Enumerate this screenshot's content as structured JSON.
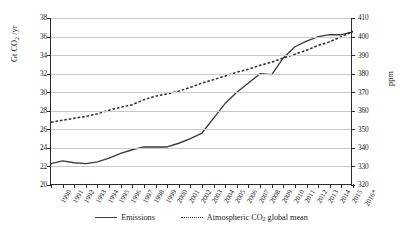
{
  "chart_data": {
    "type": "line",
    "title": "",
    "xlabel": "",
    "ylabel": "Gt CO2 /yr",
    "ylabel_right": "ppm",
    "grid": true,
    "legend_position": "bottom",
    "ylim": [
      20,
      38
    ],
    "ylim_right": [
      320,
      410
    ],
    "ytick_labels": [
      "38",
      "36",
      "34",
      "32",
      "30",
      "28",
      "26",
      "24",
      "22",
      "20"
    ],
    "ytick_values": [
      38,
      36,
      34,
      32,
      30,
      28,
      26,
      24,
      22,
      20
    ],
    "ytick_labels_right": [
      "410",
      "400",
      "390",
      "380",
      "370",
      "360",
      "350",
      "340",
      "330",
      "320"
    ],
    "ytick_values_right": [
      410,
      400,
      390,
      380,
      370,
      360,
      350,
      340,
      330,
      320
    ],
    "categories": [
      "1990",
      "1991",
      "1992",
      "1993",
      "1994",
      "1995",
      "1996",
      "1997",
      "1998",
      "1999",
      "2000",
      "2001",
      "2002",
      "2003",
      "2004",
      "2005",
      "2006",
      "2007",
      "2008",
      "2009",
      "2010",
      "2011",
      "2012",
      "2013",
      "2014",
      "2015",
      "2016*"
    ],
    "series": [
      {
        "name": "Emissions",
        "style": "solid",
        "axis": "left",
        "unit": "Gt CO2 /yr",
        "values": [
          22.3,
          22.6,
          22.4,
          22.3,
          22.5,
          22.9,
          23.4,
          23.8,
          24.1,
          24.1,
          24.1,
          24.5,
          25.0,
          25.6,
          27.2,
          28.8,
          30.0,
          31.0,
          32.0,
          31.9,
          33.7,
          34.9,
          35.5,
          36.0,
          36.2,
          36.2,
          36.5
        ]
      },
      {
        "name": "Atmospheric CO2 global mean",
        "style": "dotted",
        "axis": "right",
        "unit": "ppm",
        "values": [
          353.8,
          354.9,
          356.0,
          356.9,
          358.4,
          360.3,
          361.9,
          363.3,
          365.9,
          367.9,
          369.1,
          370.6,
          372.6,
          374.9,
          376.8,
          378.7,
          380.8,
          382.4,
          384.5,
          386.2,
          388.4,
          390.5,
          392.6,
          395.2,
          397.2,
          399.9,
          402.8
        ]
      }
    ],
    "series_colors": {
      "emissions": "#3a3a3a",
      "co2": "#2b2b2b",
      "gridline": "#c9c9c9",
      "axis": "#2b2b2b"
    },
    "note": "2016*"
  }
}
